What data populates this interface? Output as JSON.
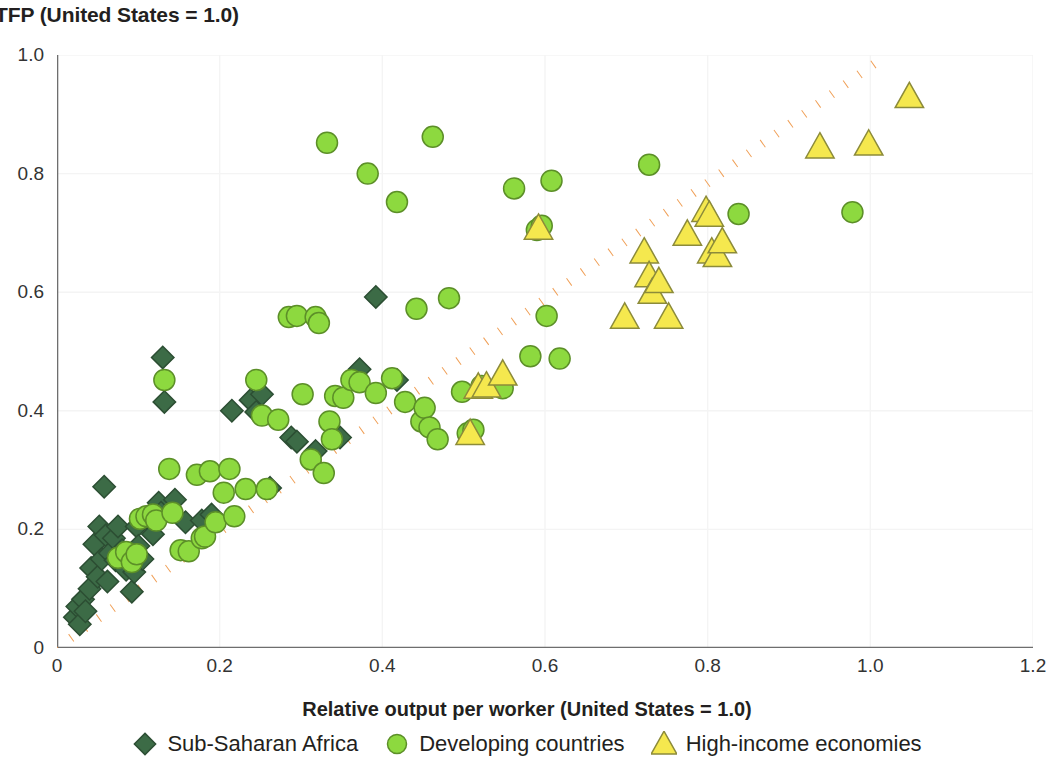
{
  "chart_data": {
    "type": "scatter",
    "title": "TFP (United States = 1.0)",
    "xlabel": "Relative output per worker (United States = 1.0)",
    "ylabel": "TFP (United States = 1.0)",
    "xlim": [
      0,
      1.2
    ],
    "ylim": [
      0,
      1.0
    ],
    "xticks": [
      "0",
      "0.2",
      "0.4",
      "0.6",
      "0.8",
      "1.0",
      "1.2"
    ],
    "xtick_values": [
      0,
      0.2,
      0.4,
      0.6,
      0.8,
      1.0,
      1.2
    ],
    "yticks": [
      "0",
      "0.2",
      "0.4",
      "0.6",
      "0.8",
      "1.0"
    ],
    "ytick_values": [
      0,
      0.2,
      0.4,
      0.6,
      0.8,
      1.0
    ],
    "grid": true,
    "legend_position": "bottom",
    "reference_line": {
      "label": "45-degree line",
      "color": "#F0A058",
      "style": "dotted",
      "x": [
        0.0,
        1.02
      ],
      "y": [
        0.0,
        1.0
      ]
    },
    "series": [
      {
        "name": "Sub-Saharan Africa",
        "marker": "diamond",
        "color": "#3C6B46",
        "edge": "#2C4E33",
        "points": [
          [
            0.022,
            0.052
          ],
          [
            0.025,
            0.07
          ],
          [
            0.028,
            0.04
          ],
          [
            0.032,
            0.082
          ],
          [
            0.035,
            0.062
          ],
          [
            0.04,
            0.1
          ],
          [
            0.042,
            0.135
          ],
          [
            0.046,
            0.175
          ],
          [
            0.05,
            0.12
          ],
          [
            0.052,
            0.205
          ],
          [
            0.055,
            0.15
          ],
          [
            0.058,
            0.272
          ],
          [
            0.06,
            0.19
          ],
          [
            0.062,
            0.112
          ],
          [
            0.065,
            0.16
          ],
          [
            0.07,
            0.185
          ],
          [
            0.072,
            0.148
          ],
          [
            0.075,
            0.205
          ],
          [
            0.08,
            0.165
          ],
          [
            0.085,
            0.132
          ],
          [
            0.088,
            0.155
          ],
          [
            0.092,
            0.095
          ],
          [
            0.095,
            0.128
          ],
          [
            0.098,
            0.205
          ],
          [
            0.1,
            0.172
          ],
          [
            0.105,
            0.15
          ],
          [
            0.112,
            0.218
          ],
          [
            0.118,
            0.192
          ],
          [
            0.125,
            0.245
          ],
          [
            0.128,
            0.228
          ],
          [
            0.13,
            0.49
          ],
          [
            0.132,
            0.415
          ],
          [
            0.145,
            0.25
          ],
          [
            0.158,
            0.212
          ],
          [
            0.178,
            0.215
          ],
          [
            0.19,
            0.225
          ],
          [
            0.215,
            0.4
          ],
          [
            0.238,
            0.418
          ],
          [
            0.245,
            0.398
          ],
          [
            0.252,
            0.428
          ],
          [
            0.262,
            0.27
          ],
          [
            0.288,
            0.355
          ],
          [
            0.295,
            0.348
          ],
          [
            0.318,
            0.332
          ],
          [
            0.348,
            0.355
          ],
          [
            0.372,
            0.47
          ],
          [
            0.392,
            0.592
          ],
          [
            0.418,
            0.452
          ]
        ]
      },
      {
        "name": "Developing countries",
        "marker": "circle",
        "color": "#8DD93F",
        "edge": "#5C8F28",
        "points": [
          [
            0.075,
            0.152
          ],
          [
            0.085,
            0.162
          ],
          [
            0.092,
            0.145
          ],
          [
            0.098,
            0.158
          ],
          [
            0.102,
            0.218
          ],
          [
            0.11,
            0.222
          ],
          [
            0.118,
            0.225
          ],
          [
            0.122,
            0.215
          ],
          [
            0.132,
            0.452
          ],
          [
            0.138,
            0.302
          ],
          [
            0.142,
            0.228
          ],
          [
            0.152,
            0.165
          ],
          [
            0.162,
            0.163
          ],
          [
            0.172,
            0.292
          ],
          [
            0.178,
            0.185
          ],
          [
            0.182,
            0.188
          ],
          [
            0.188,
            0.298
          ],
          [
            0.195,
            0.212
          ],
          [
            0.205,
            0.262
          ],
          [
            0.212,
            0.302
          ],
          [
            0.218,
            0.222
          ],
          [
            0.232,
            0.268
          ],
          [
            0.245,
            0.452
          ],
          [
            0.252,
            0.392
          ],
          [
            0.258,
            0.268
          ],
          [
            0.272,
            0.385
          ],
          [
            0.285,
            0.558
          ],
          [
            0.295,
            0.56
          ],
          [
            0.302,
            0.428
          ],
          [
            0.312,
            0.318
          ],
          [
            0.318,
            0.558
          ],
          [
            0.322,
            0.548
          ],
          [
            0.328,
            0.295
          ],
          [
            0.332,
            0.852
          ],
          [
            0.335,
            0.382
          ],
          [
            0.338,
            0.352
          ],
          [
            0.342,
            0.425
          ],
          [
            0.352,
            0.422
          ],
          [
            0.362,
            0.452
          ],
          [
            0.372,
            0.448
          ],
          [
            0.382,
            0.8
          ],
          [
            0.392,
            0.43
          ],
          [
            0.412,
            0.455
          ],
          [
            0.418,
            0.752
          ],
          [
            0.428,
            0.415
          ],
          [
            0.442,
            0.572
          ],
          [
            0.448,
            0.382
          ],
          [
            0.452,
            0.405
          ],
          [
            0.458,
            0.372
          ],
          [
            0.462,
            0.862
          ],
          [
            0.468,
            0.352
          ],
          [
            0.482,
            0.59
          ],
          [
            0.498,
            0.432
          ],
          [
            0.505,
            0.362
          ],
          [
            0.512,
            0.368
          ],
          [
            0.522,
            0.442
          ],
          [
            0.548,
            0.438
          ],
          [
            0.562,
            0.775
          ],
          [
            0.582,
            0.492
          ],
          [
            0.59,
            0.705
          ],
          [
            0.596,
            0.712
          ],
          [
            0.602,
            0.56
          ],
          [
            0.608,
            0.788
          ],
          [
            0.618,
            0.488
          ],
          [
            0.728,
            0.815
          ],
          [
            0.838,
            0.732
          ],
          [
            0.978,
            0.735
          ]
        ]
      },
      {
        "name": "High-income economies",
        "marker": "triangle",
        "color": "#F5E84E",
        "edge": "#8C8B3A",
        "points": [
          [
            0.508,
            0.362
          ],
          [
            0.518,
            0.44
          ],
          [
            0.528,
            0.442
          ],
          [
            0.548,
            0.462
          ],
          [
            0.592,
            0.708
          ],
          [
            0.698,
            0.558
          ],
          [
            0.722,
            0.668
          ],
          [
            0.728,
            0.628
          ],
          [
            0.732,
            0.6
          ],
          [
            0.74,
            0.618
          ],
          [
            0.752,
            0.558
          ],
          [
            0.775,
            0.698
          ],
          [
            0.798,
            0.738
          ],
          [
            0.802,
            0.73
          ],
          [
            0.805,
            0.668
          ],
          [
            0.812,
            0.662
          ],
          [
            0.818,
            0.685
          ],
          [
            0.938,
            0.845
          ],
          [
            0.998,
            0.85
          ],
          [
            1.048,
            0.93
          ]
        ]
      }
    ]
  },
  "legend": {
    "items": [
      {
        "label": "Sub-Saharan Africa",
        "marker": "diamond",
        "color": "#3C6B46",
        "edge": "#2C4E33"
      },
      {
        "label": "Developing countries",
        "marker": "circle",
        "color": "#8DD93F",
        "edge": "#5C8F28"
      },
      {
        "label": "High-income economies",
        "marker": "triangle",
        "color": "#F5E84E",
        "edge": "#8C8B3A"
      }
    ]
  },
  "style": {
    "axis_color": "#6E6E6E",
    "grid_color": "#F4F4F4",
    "background": "#FFFFFF",
    "reference_line_color": "#F0A058"
  }
}
